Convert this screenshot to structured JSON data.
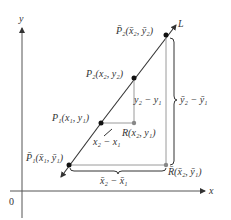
{
  "figure": {
    "axes": {
      "x_label": "x",
      "y_label": "y",
      "origin_label": "0"
    },
    "line_label": "L",
    "points": {
      "P2bar": "P̄₂(x̄₂, ȳ₂)",
      "P2": "P₂(x₂, y₂)",
      "P1": "P₁(x₁, y₁)",
      "P1bar": "P̄₁(x̄₁, ȳ₁)",
      "R": "R(x₂, y₁)",
      "Rbar": "R̄(x̄₂, ȳ₁)"
    },
    "differences": {
      "rise": "y₂ − y₁",
      "run": "x₂ − x₁",
      "rise_bar": "ȳ₂ − ȳ₁",
      "run_bar": "x̄₂ − x̄₁"
    },
    "colors": {
      "ink": "#333333",
      "guide": "#9a9a9a",
      "point": "#111111",
      "r_point": "#888888"
    }
  }
}
